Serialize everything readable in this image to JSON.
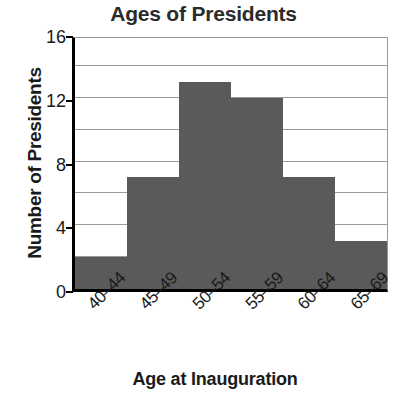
{
  "chart_data": {
    "type": "bar",
    "title": "Ages of Presidents",
    "xlabel": "Age at Inauguration",
    "ylabel": "Number of Presidents",
    "categories": [
      "40–44",
      "45–49",
      "50–54",
      "55–59",
      "60–64",
      "65–69"
    ],
    "values": [
      2,
      7,
      13,
      12,
      7,
      3
    ],
    "ylim": [
      0,
      16
    ],
    "ytick_labels": [
      "0",
      "4",
      "8",
      "12",
      "16"
    ],
    "ytick_values": [
      0,
      4,
      8,
      12,
      16
    ],
    "gridline_values": [
      2,
      4,
      6,
      8,
      10,
      12,
      14,
      16
    ],
    "grid": true,
    "legend": "none",
    "bar_color": "#5a5a5a",
    "axis_color": "#000000",
    "grid_color": "#9a9a9a",
    "background": "#ffffff",
    "text_color": "#1a1a1a"
  }
}
